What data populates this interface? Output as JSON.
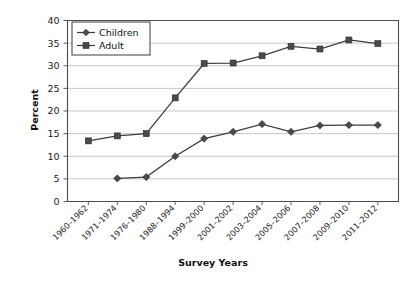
{
  "chart_data": {
    "type": "line",
    "title": "",
    "xlabel": "Survey Years",
    "ylabel": "Percent",
    "ylim": [
      0,
      40
    ],
    "yticks": [
      0,
      5,
      10,
      15,
      20,
      25,
      30,
      35,
      40
    ],
    "grid": true,
    "legend_position": "top-left",
    "categories": [
      "1960–1962",
      "1971–1974",
      "1976–1980",
      "1988–1994",
      "1999–2000",
      "2001–2002",
      "2003–2004",
      "2005–2006",
      "2007–2008",
      "2009–2010",
      "2011–2012"
    ],
    "series": [
      {
        "name": "Children",
        "marker": "diamond",
        "values": [
          null,
          5.1,
          5.4,
          10.0,
          13.9,
          15.4,
          17.1,
          15.4,
          16.8,
          16.9,
          16.9
        ]
      },
      {
        "name": "Adult",
        "marker": "square",
        "values": [
          13.4,
          14.5,
          15.0,
          22.9,
          30.5,
          30.6,
          32.2,
          34.3,
          33.7,
          35.7,
          34.9
        ]
      }
    ]
  },
  "axes": {
    "y_title": "Percent",
    "x_title": "Survey Years",
    "y_tick_labels": [
      "0",
      "5",
      "10",
      "15",
      "20",
      "25",
      "30",
      "35",
      "40"
    ]
  },
  "legend": {
    "entries": [
      {
        "label": "Children",
        "marker": "diamond-marker"
      },
      {
        "label": "Adult",
        "marker": "square-marker"
      }
    ]
  },
  "colors": {
    "line": "#3d3d3d",
    "marker": "#4a4a4a",
    "grid": "#b0b0b0",
    "axis": "#4d4d4d",
    "background": "#ffffff"
  }
}
